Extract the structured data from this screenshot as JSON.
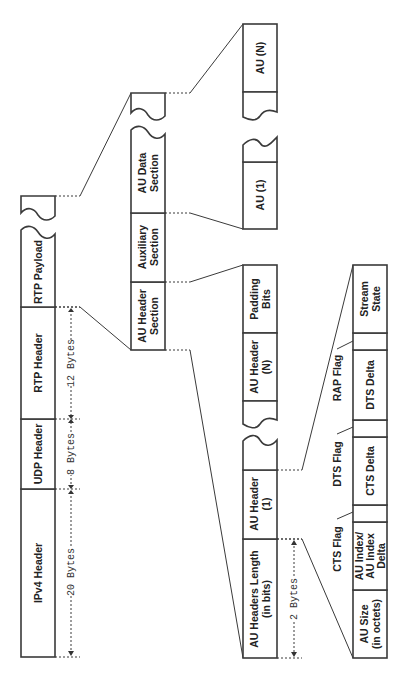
{
  "packet": {
    "ipv4": "IPv4 Header",
    "udp": "UDP Header",
    "rtp": "RTP Header",
    "payload": "RTP Payload",
    "ipv4_size": "20 Bytes",
    "udp_size": "8 Bytes",
    "rtp_size": "12 Bytes"
  },
  "payload_sections": {
    "au_header": [
      "AU Header",
      "Section"
    ],
    "auxiliary": [
      "Auxiliary",
      "Section"
    ],
    "au_data": [
      "AU Data",
      "Section"
    ]
  },
  "au_data": {
    "first": "AU (1)",
    "last": "AU (N)"
  },
  "au_header_section": {
    "length": [
      "AU Headers Length",
      "(in bits)"
    ],
    "length_size": "2 Bytes",
    "header_1": [
      "AU Header",
      "(1)"
    ],
    "header_n": [
      "AU Header",
      "(N)"
    ],
    "padding": [
      "Padding",
      "Bits"
    ]
  },
  "au_header_fields": {
    "size": [
      "AU Size",
      "(in octets)"
    ],
    "index": [
      "AU Index/",
      "AU Index",
      "Delta"
    ],
    "cts_flag": "CTS Flag",
    "cts_delta": "CTS Delta",
    "dts_flag": "DTS Flag",
    "dts_delta": "DTS Delta",
    "rap_flag": "RAP Flag",
    "stream_state": [
      "Stream",
      "State"
    ]
  }
}
